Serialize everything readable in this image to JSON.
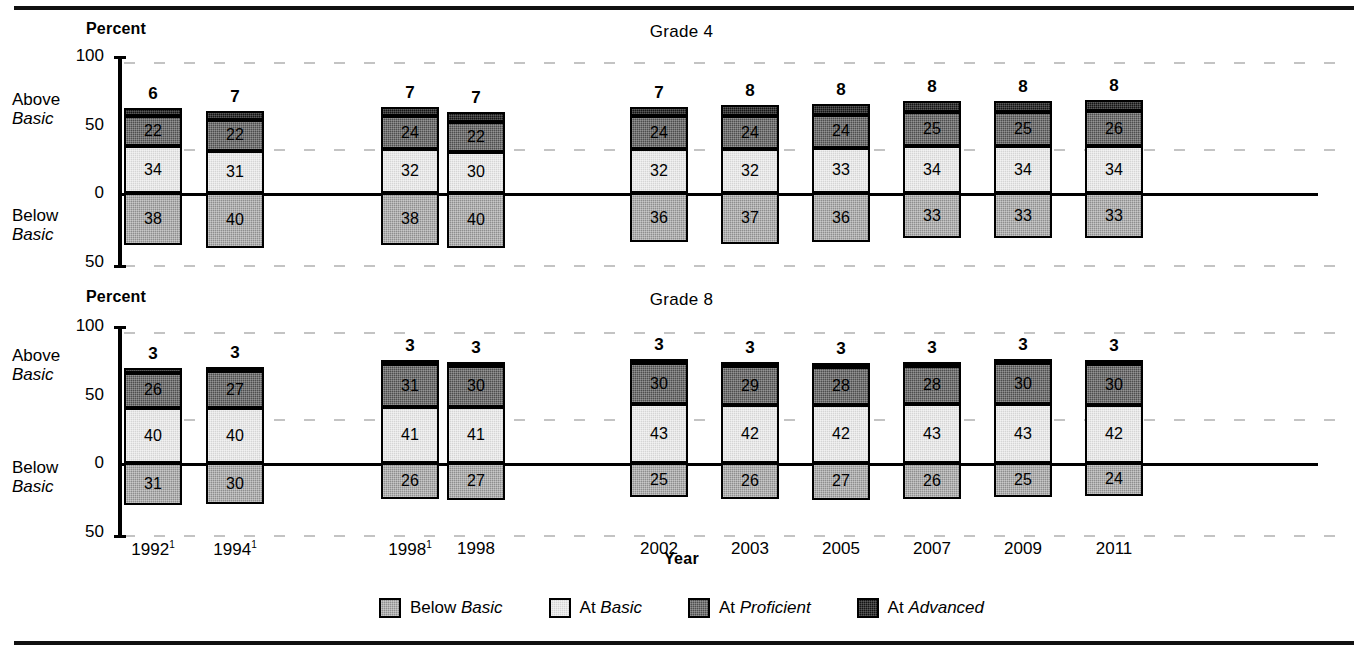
{
  "figure": {
    "x_axis_title": "Year",
    "y_axis_unit": "Percent",
    "above_label_line1": "Above",
    "above_label_line2": "Basic",
    "below_label_line1": "Below",
    "below_label_line2": "Basic",
    "y_ticks": [
      "100",
      "50",
      "0",
      "50"
    ]
  },
  "legend": {
    "items": [
      {
        "label_prefix": "Below ",
        "label_em": "Basic",
        "key": "below",
        "color": "#8e8e8e"
      },
      {
        "label_prefix": "At ",
        "label_em": "Basic",
        "key": "basic",
        "color": "#d5d5d5"
      },
      {
        "label_prefix": "At ",
        "label_em": "Proficient",
        "key": "proficient",
        "color": "#4d4d4d"
      },
      {
        "label_prefix": "At ",
        "label_em": "Advanced",
        "key": "advanced",
        "color": "#141414"
      }
    ]
  },
  "chart_data": [
    {
      "type": "bar",
      "title": "Grade 4",
      "xlabel": "Year",
      "ylabel": "Percent",
      "ylim": [
        -50,
        100
      ],
      "grid": true,
      "legend_position": "bottom",
      "categories": [
        "1992¹",
        "1994¹",
        "",
        "1998¹",
        "1998",
        "",
        "2002",
        "2003",
        "2005",
        "2007",
        "2009",
        "2011"
      ],
      "series": [
        {
          "name": "Below Basic",
          "values": [
            38,
            40,
            null,
            38,
            40,
            null,
            36,
            37,
            36,
            33,
            33,
            33
          ]
        },
        {
          "name": "At Basic",
          "values": [
            34,
            31,
            null,
            32,
            30,
            null,
            32,
            32,
            33,
            34,
            34,
            34
          ]
        },
        {
          "name": "At Proficient",
          "values": [
            22,
            22,
            null,
            24,
            22,
            null,
            24,
            24,
            24,
            25,
            25,
            26
          ]
        },
        {
          "name": "At Advanced",
          "values": [
            6,
            7,
            null,
            7,
            7,
            null,
            7,
            8,
            8,
            8,
            8,
            8
          ]
        }
      ]
    },
    {
      "type": "bar",
      "title": "Grade 8",
      "xlabel": "Year",
      "ylabel": "Percent",
      "ylim": [
        -50,
        100
      ],
      "grid": true,
      "legend_position": "bottom",
      "categories": [
        "1992¹",
        "1994¹",
        "",
        "1998¹",
        "1998",
        "",
        "2002",
        "2003",
        "2005",
        "2007",
        "2009",
        "2011"
      ],
      "series": [
        {
          "name": "Below Basic",
          "values": [
            31,
            30,
            null,
            26,
            27,
            null,
            25,
            26,
            27,
            26,
            25,
            24
          ]
        },
        {
          "name": "At Basic",
          "values": [
            40,
            40,
            null,
            41,
            41,
            null,
            43,
            42,
            42,
            43,
            43,
            42
          ]
        },
        {
          "name": "At Proficient",
          "values": [
            26,
            27,
            null,
            31,
            30,
            null,
            30,
            29,
            28,
            28,
            30,
            30
          ]
        },
        {
          "name": "At Advanced",
          "values": [
            3,
            3,
            null,
            3,
            3,
            null,
            3,
            3,
            3,
            3,
            3,
            3
          ]
        }
      ]
    }
  ],
  "x_tick_labels": [
    {
      "text": "1992",
      "sup": "1"
    },
    {
      "text": "1994",
      "sup": "1"
    },
    {
      "text": "1998",
      "sup": "1"
    },
    {
      "text": "1998",
      "sup": ""
    },
    {
      "text": "2002",
      "sup": ""
    },
    {
      "text": "2003",
      "sup": ""
    },
    {
      "text": "2005",
      "sup": ""
    },
    {
      "text": "2007",
      "sup": ""
    },
    {
      "text": "2009",
      "sup": ""
    },
    {
      "text": "2011",
      "sup": ""
    }
  ]
}
